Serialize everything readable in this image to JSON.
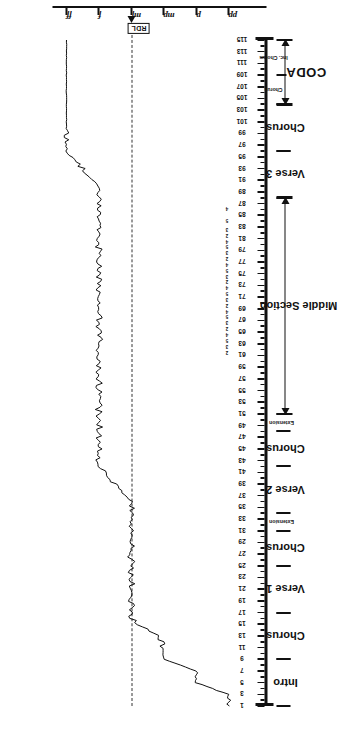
{
  "chart_data": {
    "type": "line",
    "title": "",
    "xlabel": "",
    "ylabel": "",
    "orientation": "rotated-90ccw",
    "dynamics_axis": {
      "name": "dynamic level",
      "ticks": [
        "ff",
        "f",
        "mf",
        "mp",
        "p",
        "pp"
      ],
      "reference_marker": "RDL",
      "reference_marker_position": "mf",
      "reference_line_style": "dashed"
    },
    "bar_axis": {
      "name": "bar number",
      "label_step": 2,
      "first": 1,
      "last": 115,
      "tick_labels": [
        "1",
        "3",
        "5",
        "7",
        "9",
        "11",
        "13",
        "15",
        "17",
        "19",
        "21",
        "23",
        "25",
        "27",
        "29",
        "31",
        "33",
        "35",
        "37",
        "39",
        "41",
        "43",
        "45",
        "47",
        "49",
        "51",
        "53",
        "55",
        "57",
        "59",
        "61",
        "63",
        "65",
        "67",
        "69",
        "71",
        "73",
        "75",
        "77",
        "79",
        "81",
        "83",
        "85",
        "87",
        "89",
        "91",
        "93",
        "95",
        "97",
        "99",
        "101",
        "103",
        "105",
        "107",
        "109",
        "111",
        "113",
        "115"
      ]
    },
    "beat_groups": {
      "note": "small beat subdivision numerals printed beneath bars in the Middle Section",
      "pattern": [
        "5",
        "4",
        "2",
        "3"
      ],
      "ranges": [
        {
          "from_bar": 61,
          "to_bar": 63,
          "values": [
            "2",
            "3"
          ]
        },
        {
          "from_bar": 63,
          "to_bar": 67,
          "values": [
            "5",
            "4",
            "2",
            "3"
          ]
        },
        {
          "from_bar": 67,
          "to_bar": 71,
          "values": [
            "5",
            "4",
            "2",
            "3"
          ]
        },
        {
          "from_bar": 71,
          "to_bar": 75,
          "values": [
            "5",
            "4",
            "2",
            "3"
          ]
        },
        {
          "from_bar": 75,
          "to_bar": 79,
          "values": [
            "5",
            "4",
            "2",
            "3"
          ]
        },
        {
          "from_bar": 79,
          "to_bar": 83,
          "values": [
            "5",
            "4",
            "2",
            "3"
          ]
        },
        {
          "from_bar": 83,
          "to_bar": 87,
          "values": [
            "5",
            "4"
          ]
        }
      ]
    },
    "sections": [
      {
        "label": "Intro",
        "from_bar": 1,
        "to_bar": 9,
        "size": "mid"
      },
      {
        "label": "Chorus",
        "from_bar": 9,
        "to_bar": 17,
        "size": "mid"
      },
      {
        "label": "Verse 1",
        "from_bar": 17,
        "to_bar": 25,
        "size": "mid"
      },
      {
        "label": "Chorus",
        "from_bar": 25,
        "to_bar": 31,
        "size": "mid"
      },
      {
        "label": "Extension",
        "from_bar": 31,
        "to_bar": 34,
        "size": "small"
      },
      {
        "label": "Verse 2",
        "from_bar": 34,
        "to_bar": 42,
        "size": "mid"
      },
      {
        "label": "Chorus",
        "from_bar": 42,
        "to_bar": 48,
        "size": "mid"
      },
      {
        "label": "Extension",
        "from_bar": 48,
        "to_bar": 51,
        "size": "small"
      },
      {
        "label": "Verse 3",
        "from_bar": 88,
        "to_bar": 96,
        "size": "mid"
      },
      {
        "label": "Chorus",
        "from_bar": 96,
        "to_bar": 104,
        "size": "mid"
      }
    ],
    "spans": [
      {
        "label": "Middle Section",
        "from_bar": 51,
        "to_bar": 88,
        "size": "mid",
        "arrows": "both"
      },
      {
        "label": "CODA",
        "from_bar": 104,
        "to_bar": 115,
        "size": "big",
        "arrows": "both"
      }
    ],
    "coda_sublabels": [
      {
        "label": "Chorus",
        "from_bar": 104,
        "to_bar": 109
      },
      {
        "label": "Inc. Chorus",
        "from_bar": 109,
        "to_bar": 115
      }
    ],
    "series": [
      {
        "name": "dynamic level",
        "description": "continuous measured loudness curve across the piece, read against the ff..pp scale",
        "points": [
          {
            "bar": 1,
            "dyn": "pp"
          },
          {
            "bar": 3,
            "dyn": "pp"
          },
          {
            "bar": 5,
            "dyn": "p"
          },
          {
            "bar": 7,
            "dyn": "p"
          },
          {
            "bar": 9,
            "dyn": "mp"
          },
          {
            "bar": 12,
            "dyn": "mp"
          },
          {
            "bar": 16,
            "dyn": "mf"
          },
          {
            "bar": 20,
            "dyn": "mf"
          },
          {
            "bar": 25,
            "dyn": "mf"
          },
          {
            "bar": 31,
            "dyn": "mf"
          },
          {
            "bar": 36,
            "dyn": "mf"
          },
          {
            "bar": 42,
            "dyn": "f"
          },
          {
            "bar": 48,
            "dyn": "f"
          },
          {
            "bar": 51,
            "dyn": "f"
          },
          {
            "bar": 57,
            "dyn": "f"
          },
          {
            "bar": 63,
            "dyn": "f"
          },
          {
            "bar": 70,
            "dyn": "f"
          },
          {
            "bar": 77,
            "dyn": "f"
          },
          {
            "bar": 84,
            "dyn": "f"
          },
          {
            "bar": 90,
            "dyn": "f"
          },
          {
            "bar": 96,
            "dyn": "ff"
          },
          {
            "bar": 101,
            "dyn": "ff"
          },
          {
            "bar": 104,
            "dyn": "ff"
          },
          {
            "bar": 109,
            "dyn": "ff"
          },
          {
            "bar": 115,
            "dyn": "ff"
          }
        ]
      }
    ]
  }
}
